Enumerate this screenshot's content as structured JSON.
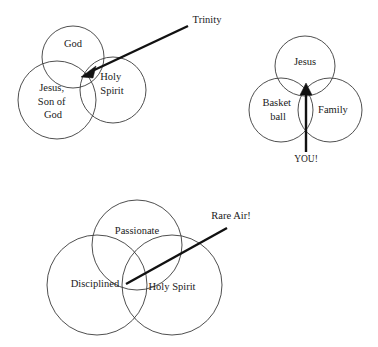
{
  "page": {
    "background_color": "#ffffff",
    "stroke_color": "#3b3b3b",
    "text_color": "#1a1a1a",
    "arrow_color": "#111111",
    "width": 378,
    "height": 347
  },
  "diagrams": [
    {
      "id": "trinity",
      "name": "Trinity diagram",
      "circles": [
        {
          "label": "God",
          "label_lines": [
            "God"
          ],
          "cx": 73,
          "cy": 57,
          "r": 31,
          "label_x": 73,
          "label_y": 45
        },
        {
          "label": "Jesus, Son of God",
          "label_lines": [
            "Jesus,",
            "Son of",
            "God"
          ],
          "cx": 57,
          "cy": 100,
          "r": 39,
          "label_x": 53,
          "label_y": 89
        },
        {
          "label": "Holy Spirit",
          "label_lines": [
            "Holy",
            "Spirit"
          ],
          "cx": 113,
          "cy": 90,
          "r": 33,
          "label_x": 112,
          "label_y": 78
        }
      ],
      "callout": {
        "label": "Trinity",
        "label_x": 207,
        "label_y": 21,
        "line_from_x": 188,
        "line_from_y": 26,
        "line_to_x": 83,
        "line_to_y": 76,
        "arrow": "arrow-head-at-end"
      }
    },
    {
      "id": "you",
      "name": "YOU diagram",
      "circles": [
        {
          "label": "Jesus",
          "label_lines": [
            "Jesus"
          ],
          "cx": 305,
          "cy": 66,
          "r": 30,
          "label_x": 305,
          "label_y": 63
        },
        {
          "label": "Basketball",
          "label_lines": [
            "Basket",
            "ball"
          ],
          "cx": 281,
          "cy": 110,
          "r": 32,
          "label_x": 278,
          "label_y": 104
        },
        {
          "label": "Family",
          "label_lines": [
            "Family"
          ],
          "cx": 330,
          "cy": 110,
          "r": 32,
          "label_x": 333,
          "label_y": 111
        }
      ],
      "callout": {
        "label": "YOU!",
        "label_x": 306,
        "label_y": 160,
        "line_from_x": 306,
        "line_from_y": 152,
        "line_to_x": 306,
        "line_to_y": 85,
        "arrow": "arrow-head-at-end"
      }
    },
    {
      "id": "rare-air",
      "name": "Rare Air diagram",
      "circles": [
        {
          "label": "Passionate",
          "label_lines": [
            "Passionate"
          ],
          "cx": 137,
          "cy": 245,
          "r": 45,
          "label_x": 137,
          "label_y": 232
        },
        {
          "label": "Disciplined",
          "label_lines": [
            "Disciplined"
          ],
          "cx": 97,
          "cy": 285,
          "r": 50,
          "label_x": 95,
          "label_y": 285
        },
        {
          "label": "Holy Spirit",
          "label_lines": [
            "Holy Spirit"
          ],
          "cx": 172,
          "cy": 285,
          "r": 50,
          "label_x": 172,
          "label_y": 288
        }
      ],
      "callout": {
        "label": "Rare Air!",
        "label_x": 256,
        "label_y": 217,
        "line_from_x": 227,
        "line_from_y": 228,
        "line_to_x": 126,
        "line_to_y": 284,
        "arrow": "none"
      }
    }
  ]
}
